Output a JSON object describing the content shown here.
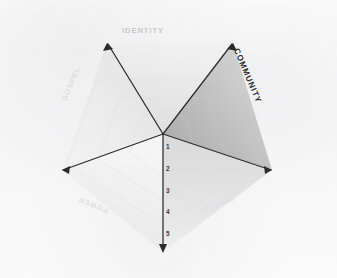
{
  "chart_data": {
    "type": "radar",
    "title": "",
    "categories": [
      "IDENTITY",
      "COMMUNITY",
      "MISSION",
      "POWER",
      "GOSPEL"
    ],
    "scale_ticks": [
      "1",
      "2",
      "3",
      "4",
      "5"
    ],
    "scale_axis": "vertical-downward",
    "rlim": [
      0,
      5
    ],
    "grid": "banded-rings",
    "legend": "none",
    "series": [
      {
        "name": "outline",
        "values": [
          5,
          5,
          5,
          5,
          5
        ]
      }
    ],
    "emphasis": {
      "axis": "COMMUNITY",
      "note": "COMMUNITY sector shaded darker and its label printed in dark bold type"
    },
    "sector_shading": [
      {
        "axis_from": "GOSPEL",
        "axis_to": "IDENTITY",
        "fill": "#ececec"
      },
      {
        "axis_from": "IDENTITY",
        "axis_to": "COMMUNITY",
        "fill": "#e3e3e3"
      },
      {
        "axis_from": "COMMUNITY",
        "axis_to": "MISSION",
        "fill": "#b9b9b9"
      },
      {
        "axis_from": "MISSION",
        "axis_to": "POWER",
        "fill": "#e0e0e0"
      },
      {
        "axis_from": "POWER",
        "axis_to": "GOSPEL",
        "fill": "#e8e8e8"
      }
    ]
  },
  "axes": {
    "identity": {
      "label": "IDENTITY",
      "color": "#c9c9cb",
      "font_size": "7.6px",
      "rotation_deg": 0,
      "x": 143,
      "y": 31
    },
    "community": {
      "label": "COMMUNITY",
      "color": "#2e2e30",
      "font_size": "8.2px",
      "rotation_deg": 67,
      "x": 247,
      "y": 76
    },
    "gospel": {
      "label": "GOSPEL",
      "color": "#dcdcde",
      "font_size": "7.4px",
      "rotation_deg": -66,
      "x": 71,
      "y": 84
    },
    "power": {
      "label": "POWER",
      "color": "#e0e0e2",
      "font_size": "7.2px",
      "rotation_deg": 203,
      "x": 93,
      "y": 205
    },
    "mission": {
      "label": "MISSION",
      "color": "#dfdfe1",
      "font_size": "7.2px",
      "rotation_deg": 157,
      "x": 216,
      "y": 205
    }
  },
  "ticks": [
    {
      "value": "1",
      "x": 166,
      "y": 144
    },
    {
      "value": "2",
      "x": 166,
      "y": 166
    },
    {
      "value": "3",
      "x": 166,
      "y": 188
    },
    {
      "value": "4",
      "x": 166,
      "y": 209
    },
    {
      "value": "5",
      "x": 166,
      "y": 231
    }
  ],
  "geometry": {
    "center_x": 163,
    "center_y": 134,
    "axis_color": "#2b2b2d",
    "vertices": [
      {
        "name": "identity-tip",
        "x": 107,
        "y": 43
      },
      {
        "name": "community-tip",
        "x": 233,
        "y": 43
      },
      {
        "name": "mission-tip",
        "x": 272,
        "y": 170
      },
      {
        "name": "power-tip",
        "x": 62,
        "y": 170
      },
      {
        "name": "scale-tip",
        "x": 163,
        "y": 252
      }
    ]
  }
}
